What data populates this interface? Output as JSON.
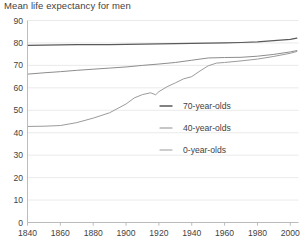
{
  "chart_data": {
    "type": "line",
    "title": "Mean life expectancy for men",
    "xlabel": "",
    "ylabel": "",
    "xlim": [
      1840,
      2005
    ],
    "ylim": [
      0,
      90
    ],
    "grid": true,
    "legend_position": "center-right",
    "xticks": [
      1840,
      1860,
      1880,
      1900,
      1920,
      1940,
      1960,
      1980,
      2000
    ],
    "yticks": [
      0,
      10,
      20,
      30,
      40,
      50,
      60,
      70,
      80,
      90
    ],
    "series": [
      {
        "name": "70-year-olds",
        "color": "#5a5a5a",
        "x": [
          1840,
          1850,
          1860,
          1870,
          1880,
          1890,
          1900,
          1910,
          1920,
          1930,
          1940,
          1950,
          1960,
          1970,
          1980,
          1990,
          2000,
          2004
        ],
        "values": [
          78.9,
          79.0,
          79.1,
          79.2,
          79.3,
          79.3,
          79.4,
          79.5,
          79.6,
          79.7,
          79.8,
          79.9,
          80.0,
          80.2,
          80.5,
          81.0,
          81.6,
          82.1
        ]
      },
      {
        "name": "40-year-olds",
        "color": "#8d8d8d",
        "x": [
          1840,
          1850,
          1860,
          1870,
          1880,
          1890,
          1900,
          1910,
          1920,
          1930,
          1940,
          1950,
          1960,
          1970,
          1980,
          1990,
          2000,
          2004
        ],
        "values": [
          66.1,
          66.7,
          67.2,
          67.8,
          68.3,
          68.8,
          69.3,
          70.0,
          70.6,
          71.3,
          72.3,
          73.3,
          73.5,
          73.6,
          74.1,
          74.9,
          76.0,
          76.6
        ]
      },
      {
        "name": "0-year-olds",
        "color": "#9b9b9b",
        "x": [
          1840,
          1850,
          1860,
          1870,
          1880,
          1890,
          1900,
          1905,
          1910,
          1915,
          1918,
          1920,
          1925,
          1930,
          1935,
          1940,
          1945,
          1950,
          1955,
          1960,
          1970,
          1980,
          1990,
          2000,
          2004
        ],
        "values": [
          42.8,
          42.9,
          43.2,
          44.5,
          46.5,
          48.9,
          52.8,
          55.5,
          57.0,
          57.8,
          56.9,
          58.3,
          60.5,
          62.2,
          64.0,
          65.0,
          67.5,
          69.8,
          71.0,
          71.3,
          72.0,
          72.8,
          74.0,
          75.4,
          76.2
        ]
      }
    ]
  },
  "legend": {
    "items": [
      {
        "label": "70-year-olds"
      },
      {
        "label": "40-year-olds"
      },
      {
        "label": "0-year-olds"
      }
    ]
  }
}
